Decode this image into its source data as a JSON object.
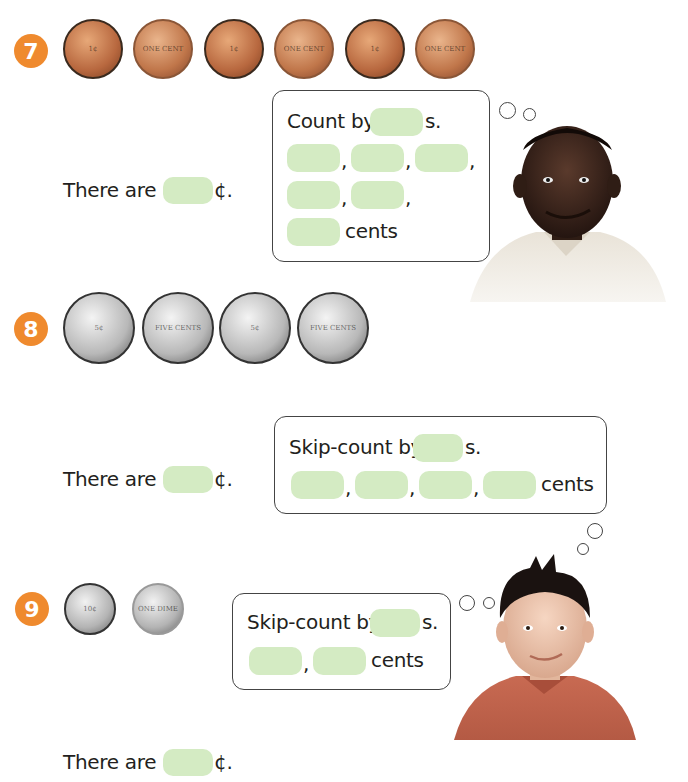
{
  "problems": [
    {
      "number": "7",
      "coins": [
        {
          "type": "penny",
          "side": "heads",
          "label": "1¢"
        },
        {
          "type": "penny",
          "side": "tails",
          "label": "ONE CENT"
        },
        {
          "type": "penny",
          "side": "heads",
          "label": "1¢"
        },
        {
          "type": "penny",
          "side": "tails",
          "label": "ONE CENT"
        },
        {
          "type": "penny",
          "side": "heads",
          "label": "1¢"
        },
        {
          "type": "penny",
          "side": "tails",
          "label": "ONE CENT"
        }
      ],
      "there_are": "There are",
      "cent_symbol": "¢.",
      "bubble": {
        "prompt": "Count by",
        "suffix": "s.",
        "comma": ",",
        "cents_label": "cents"
      },
      "thinker": "boy-smiling"
    },
    {
      "number": "8",
      "coins": [
        {
          "type": "nickel",
          "side": "heads",
          "label": "5¢"
        },
        {
          "type": "nickel",
          "side": "tails",
          "label": "FIVE CENTS"
        },
        {
          "type": "nickel",
          "side": "heads",
          "label": "5¢"
        },
        {
          "type": "nickel",
          "side": "tails",
          "label": "FIVE CENTS"
        }
      ],
      "there_are": "There are",
      "cent_symbol": "¢.",
      "bubble": {
        "prompt": "Skip-count by",
        "suffix": "s.",
        "comma": ",",
        "cents_label": "cents"
      }
    },
    {
      "number": "9",
      "coins": [
        {
          "type": "dime",
          "side": "heads",
          "label": "10¢"
        },
        {
          "type": "dime",
          "side": "tails",
          "label": "ONE DIME"
        }
      ],
      "there_are": "There are",
      "cent_symbol": "¢.",
      "bubble": {
        "prompt": "Skip-count by",
        "suffix": "s.",
        "comma": ",",
        "cents_label": "cents"
      },
      "thinker": "boy-spiky-hair"
    }
  ],
  "colors": {
    "badge": "#ef8a2e",
    "answer_box": "#d4ebc3",
    "text": "#231f20"
  }
}
